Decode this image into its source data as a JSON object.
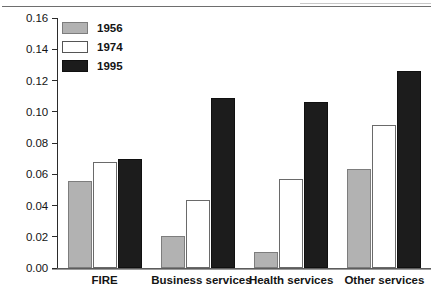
{
  "chart_data": {
    "type": "bar",
    "title": "",
    "xlabel": "",
    "ylabel": "",
    "ylim": [
      0.0,
      0.16
    ],
    "ytick_labels": [
      "0.00",
      "0.02",
      "0.04",
      "0.06",
      "0.08",
      "0.10",
      "0.12",
      "0.14",
      "0.16"
    ],
    "ytick_values": [
      0.0,
      0.02,
      0.04,
      0.06,
      0.08,
      0.1,
      0.12,
      0.14,
      0.16
    ],
    "grid": false,
    "legend_position": "top-left",
    "categories": [
      "FIRE",
      "Business services",
      "Health services",
      "Other services"
    ],
    "series": [
      {
        "name": "1956",
        "color": "#b2b2b2",
        "values": [
          0.056,
          0.0205,
          0.0105,
          0.0635
        ]
      },
      {
        "name": "1974",
        "color": "#ffffff",
        "values": [
          0.068,
          0.0435,
          0.057,
          0.0915
        ]
      },
      {
        "name": "1995",
        "color": "#1c1c1c",
        "values": [
          0.07,
          0.109,
          0.1065,
          0.126
        ]
      }
    ]
  }
}
